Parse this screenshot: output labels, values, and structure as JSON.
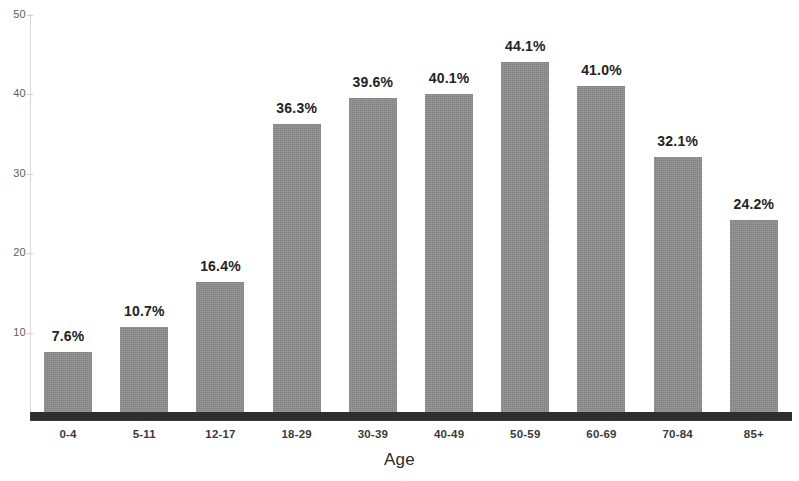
{
  "chart_data": {
    "type": "bar",
    "title": "",
    "subtitle": "",
    "xlabel": "Age",
    "ylabel": "",
    "categories": [
      "0-4",
      "5-11",
      "12-17",
      "18-29",
      "30-39",
      "40-49",
      "50-59",
      "60-69",
      "70-84",
      "85+"
    ],
    "values": [
      7.6,
      10.7,
      16.4,
      36.3,
      39.6,
      40.1,
      44.1,
      41.0,
      32.1,
      24.2
    ],
    "data_labels": [
      "7.6%",
      "10.7%",
      "16.4%",
      "36.3%",
      "39.6%",
      "40.1%",
      "44.1%",
      "41.0%",
      "32.1%",
      "24.2%"
    ],
    "ylim": [
      0,
      50
    ],
    "y_ticks": [
      10,
      20,
      30,
      40,
      50
    ],
    "y_tick_labels": [
      "10",
      "20",
      "30",
      "40",
      "50"
    ],
    "grid": false,
    "legend": false,
    "legend_position": "none",
    "bar_color": "#8d8d8d",
    "axis_color": "#2e2e2e",
    "label_color": "#232323"
  },
  "axes": {
    "x_title": "Age"
  }
}
